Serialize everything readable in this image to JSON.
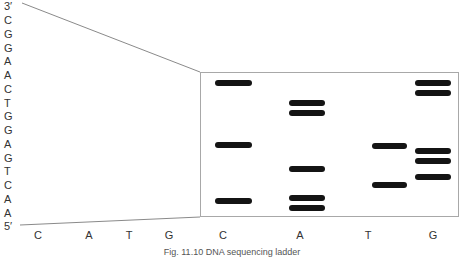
{
  "sequence": {
    "top_label": "3′",
    "bottom_label": "5′",
    "bases": [
      "C",
      "G",
      "G",
      "A",
      "A",
      "C",
      "T",
      "G",
      "G",
      "A",
      "G",
      "T",
      "C",
      "A",
      "A"
    ]
  },
  "lanes_bottom_left": [
    {
      "label": "C",
      "x": 38
    },
    {
      "label": "A",
      "x": 89
    },
    {
      "label": "T",
      "x": 129
    },
    {
      "label": "G",
      "x": 169
    }
  ],
  "gel": {
    "lanes": [
      {
        "label": "C",
        "x": 223,
        "band_left": 215,
        "band_width": 37,
        "bands_y": [
          83,
          145,
          201
        ]
      },
      {
        "label": "A",
        "x": 300,
        "band_left": 289,
        "band_width": 36,
        "bands_y": [
          103,
          113,
          169,
          198,
          208
        ]
      },
      {
        "label": "T",
        "x": 368,
        "band_left": 372,
        "band_width": 35,
        "bands_y": [
          146,
          185
        ]
      },
      {
        "label": "G",
        "x": 433,
        "band_left": 415,
        "band_width": 36,
        "bands_y": [
          83,
          93,
          151,
          161,
          177
        ]
      }
    ],
    "band_color": "#141414",
    "border_color": "#a8a8a8"
  },
  "caption": "Fig. 11.10  DNA sequencing ladder"
}
